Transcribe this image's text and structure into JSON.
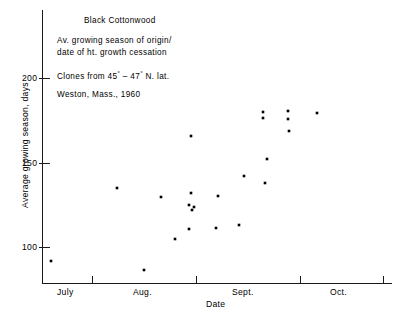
{
  "annotation": {
    "title": "Black Cottonwood",
    "line1": "Av. growing season of origin/",
    "line2": "date of ht. growth cessation",
    "line3_pre": "Clones from 45",
    "line3_mid": " – 47",
    "line3_post": " N. lat.",
    "line3_full": "Clones from 45° – 47° N. lat.",
    "line4": "Weston, Mass., 1960"
  },
  "axes": {
    "y_title": "Average growing season, days",
    "x_title": "Date",
    "y_ticks": [
      "200",
      "150",
      "100"
    ],
    "y_tick_values": [
      200,
      150,
      100
    ],
    "x_tick_labels": [
      "July",
      "Aug.",
      "Sept.",
      "Oct."
    ]
  },
  "chart_data": {
    "type": "scatter",
    "title": "Black Cottonwood",
    "subtitle": "Av. growing season of origin/date of ht. growth cessation",
    "note": "Clones from 45° – 47° N. lat. Weston, Mass., 1960",
    "xlabel": "Date",
    "ylabel": "Average growing season, days",
    "xlim": [
      0,
      123
    ],
    "ylim": [
      75,
      215
    ],
    "x_axis_unit": "days after June 21 (tick marks at June 21, July 15, Aug. 15, Sept. 15, Oct. 9 approx.)",
    "x_tick_positions_days": [
      0,
      17,
      53,
      89,
      118
    ],
    "x_tick_labels": [
      "July",
      "Aug.",
      "Sept.",
      "Oct."
    ],
    "y_ticks": [
      100,
      150,
      200
    ],
    "grid": false,
    "legend": false,
    "marker": "square",
    "marker_color": "#000000",
    "points": [
      {
        "x_px": 51,
        "y_px": 261,
        "date": "June 24",
        "value": 92
      },
      {
        "x_px": 117,
        "y_px": 188,
        "date": "July 47",
        "value": 135
      },
      {
        "x_px": 144,
        "y_px": 270,
        "date": "Aug. 2",
        "value": 87
      },
      {
        "x_px": 161,
        "y_px": 197,
        "date": "Aug. 8",
        "value": 130
      },
      {
        "x_px": 175,
        "y_px": 239,
        "date": "Aug. 13",
        "value": 105
      },
      {
        "x_px": 191,
        "y_px": 136,
        "date": "Aug. 19",
        "value": 165
      },
      {
        "x_px": 191,
        "y_px": 193,
        "date": "Aug. 19",
        "value": 132
      },
      {
        "x_px": 189,
        "y_px": 205,
        "date": "Aug. 19",
        "value": 125
      },
      {
        "x_px": 194,
        "y_px": 207,
        "date": "Aug. 20",
        "value": 124
      },
      {
        "x_px": 192,
        "y_px": 210,
        "date": "Aug. 19",
        "value": 122
      },
      {
        "x_px": 189,
        "y_px": 229,
        "date": "Aug. 19",
        "value": 111
      },
      {
        "x_px": 218,
        "y_px": 196,
        "date": "Aug. 29",
        "value": 130
      },
      {
        "x_px": 216,
        "y_px": 228,
        "date": "Aug. 28",
        "value": 112
      },
      {
        "x_px": 239,
        "y_px": 225,
        "date": "Sept. 6",
        "value": 113
      },
      {
        "x_px": 244,
        "y_px": 176,
        "date": "Sept. 8",
        "value": 142
      },
      {
        "x_px": 265,
        "y_px": 183,
        "date": "Sept. 15",
        "value": 138
      },
      {
        "x_px": 267,
        "y_px": 159,
        "date": "Sept. 16",
        "value": 152
      },
      {
        "x_px": 263,
        "y_px": 112,
        "date": "Sept. 14",
        "value": 180
      },
      {
        "x_px": 263,
        "y_px": 118,
        "date": "Sept. 14",
        "value": 176
      },
      {
        "x_px": 288,
        "y_px": 111,
        "date": "Sept. 23",
        "value": 181
      },
      {
        "x_px": 288,
        "y_px": 119,
        "date": "Sept. 23",
        "value": 176
      },
      {
        "x_px": 289,
        "y_px": 131,
        "date": "Sept. 23",
        "value": 169
      },
      {
        "x_px": 317,
        "y_px": 113,
        "date": "Oct. 2",
        "value": 179
      }
    ]
  },
  "plot_geometry": {
    "axis_color": "#1a1a1a",
    "x_axis_y_px": 283,
    "y_axis_x_px": 42,
    "x_axis_right_px": 392,
    "y_axis_top_px": 10,
    "x_tick_px": [
      42,
      92,
      196,
      300,
      383
    ],
    "y_tick_px": {
      "200": 78,
      "150": 163,
      "100": 247
    }
  }
}
